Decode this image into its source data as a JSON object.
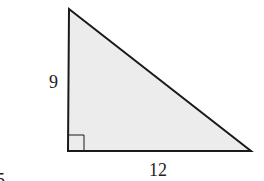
{
  "figure": {
    "type": "right-triangle",
    "fill_color": "#ececec",
    "stroke_color": "#1a1a1a",
    "vertices": {
      "top": [
        69,
        9
      ],
      "right_angle": [
        68,
        151
      ],
      "right": [
        251,
        151
      ]
    },
    "labels": {
      "vertical_leg": "9",
      "horizontal_leg": "12",
      "fragment": "5"
    },
    "right_angle_marker": true
  }
}
